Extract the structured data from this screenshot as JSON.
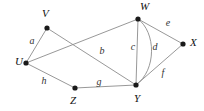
{
  "diagram": {
    "type": "undirected-multigraph",
    "title": "",
    "background_color": "#ffffff",
    "edge_color": "#8c8c8c",
    "vertex_color": "#1a1a1a",
    "label_color": "#111111",
    "width": 204,
    "height": 111,
    "vertices": [
      {
        "id": "V",
        "label": "V",
        "cx": 47,
        "cy": 28,
        "r": 2.6,
        "label_x": 42,
        "label_y": 14
      },
      {
        "id": "U",
        "label": "U",
        "cx": 26,
        "cy": 63,
        "r": 2.6,
        "label_x": 15,
        "label_y": 62
      },
      {
        "id": "W",
        "label": "W",
        "cx": 138,
        "cy": 19,
        "r": 2.6,
        "label_x": 140,
        "label_y": 7
      },
      {
        "id": "X",
        "label": "X",
        "cx": 183,
        "cy": 44,
        "r": 2.6,
        "label_x": 190,
        "label_y": 43
      },
      {
        "id": "Y",
        "label": "Y",
        "cx": 136,
        "cy": 85,
        "r": 2.6,
        "label_x": 134,
        "label_y": 99
      },
      {
        "id": "Z",
        "label": "Z",
        "cx": 75,
        "cy": 88,
        "r": 2.6,
        "label_x": 70,
        "label_y": 101
      }
    ],
    "edges": [
      {
        "id": "a",
        "label": "a",
        "from": "U",
        "to": "V",
        "shape": "line",
        "path": "M 26 63 L 47 28",
        "label_x": 32,
        "label_y": 42
      },
      {
        "id": "b",
        "label": "b",
        "from": "U",
        "to": "W",
        "shape": "line",
        "path": "M 26 63 L 138 19",
        "label_x": 102,
        "label_y": 52
      },
      {
        "id": "vy",
        "label": "",
        "from": "V",
        "to": "Y",
        "shape": "line",
        "path": "M 47 28 L 136 85",
        "label_x": 0,
        "label_y": 0
      },
      {
        "id": "c",
        "label": "c",
        "from": "W",
        "to": "Y",
        "shape": "line",
        "path": "M 138 19 L 136 85",
        "label_x": 133,
        "label_y": 48
      },
      {
        "id": "d",
        "label": "d",
        "from": "W",
        "to": "Y",
        "shape": "curve",
        "path": "M 138 19 C 156 32 157 70 136 85",
        "label_x": 155,
        "label_y": 48
      },
      {
        "id": "e",
        "label": "e",
        "from": "W",
        "to": "X",
        "shape": "line",
        "path": "M 138 19 L 183 44",
        "label_x": 168,
        "label_y": 24
      },
      {
        "id": "f",
        "label": "f",
        "from": "Y",
        "to": "X",
        "shape": "line",
        "path": "M 136 85 L 183 44",
        "label_x": 163,
        "label_y": 74
      },
      {
        "id": "g",
        "label": "g",
        "from": "Z",
        "to": "Y",
        "shape": "line",
        "path": "M 75 88 L 136 85",
        "label_x": 99,
        "label_y": 83
      },
      {
        "id": "h",
        "label": "h",
        "from": "U",
        "to": "Z",
        "shape": "line",
        "path": "M 26 63 L 75 88",
        "label_x": 44,
        "label_y": 82
      }
    ]
  }
}
